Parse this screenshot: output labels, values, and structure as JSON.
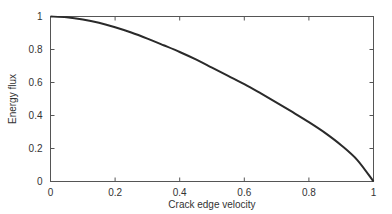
{
  "chart_data": {
    "type": "line",
    "title": "",
    "xlabel": "Crack edge velocity",
    "ylabel": "Energy flux",
    "xlim": [
      0,
      1
    ],
    "ylim": [
      0,
      1
    ],
    "xticks": [
      0,
      0.2,
      0.4,
      0.6,
      0.8,
      1
    ],
    "yticks": [
      0,
      0.2,
      0.4,
      0.6,
      0.8,
      1
    ],
    "xtick_labels": [
      "0",
      "0.2",
      "0.4",
      "0.6",
      "0.8",
      "1"
    ],
    "ytick_labels": [
      "0",
      "0.2",
      "0.4",
      "0.6",
      "0.8",
      "1"
    ],
    "grid": false,
    "legend": null,
    "series": [
      {
        "name": "Energy flux",
        "x": [
          0,
          0.05,
          0.1,
          0.15,
          0.2,
          0.25,
          0.3,
          0.35,
          0.4,
          0.45,
          0.5,
          0.55,
          0.6,
          0.65,
          0.7,
          0.75,
          0.8,
          0.85,
          0.9,
          0.95,
          1.0
        ],
        "y": [
          1.0,
          0.995,
          0.982,
          0.962,
          0.935,
          0.903,
          0.866,
          0.826,
          0.785,
          0.74,
          0.69,
          0.64,
          0.59,
          0.535,
          0.478,
          0.42,
          0.36,
          0.295,
          0.22,
          0.13,
          0.0
        ]
      }
    ]
  }
}
